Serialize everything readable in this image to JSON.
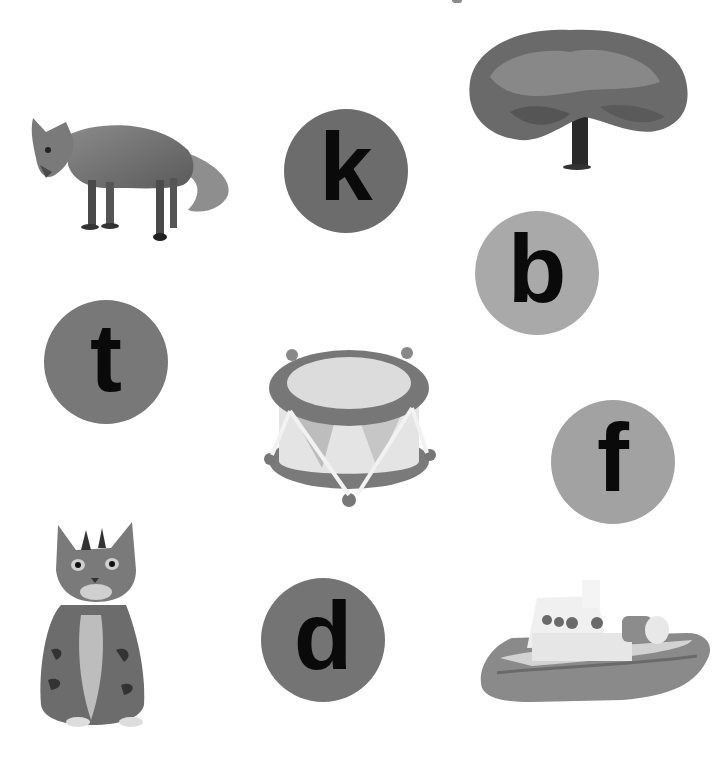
{
  "worksheet": {
    "letters": [
      {
        "id": "k",
        "label": "k",
        "cx": 346,
        "cy": 171,
        "r": 62,
        "color": "#6c6c6c"
      },
      {
        "id": "b",
        "label": "b",
        "cx": 537,
        "cy": 273,
        "r": 62,
        "color": "#a9a9a9"
      },
      {
        "id": "t",
        "label": "t",
        "cx": 106,
        "cy": 362,
        "r": 62,
        "color": "#787878"
      },
      {
        "id": "f",
        "label": "f",
        "cx": 613,
        "cy": 462,
        "r": 62,
        "color": "#a2a2a2"
      },
      {
        "id": "d",
        "label": "d",
        "cx": 323,
        "cy": 640,
        "r": 62,
        "color": "#747474"
      }
    ],
    "pictures": [
      {
        "id": "fox",
        "icon": "fox-icon"
      },
      {
        "id": "tree",
        "icon": "tree-icon"
      },
      {
        "id": "drum",
        "icon": "drum-icon"
      },
      {
        "id": "cat",
        "icon": "cat-icon"
      },
      {
        "id": "boat",
        "icon": "boat-icon"
      }
    ]
  }
}
